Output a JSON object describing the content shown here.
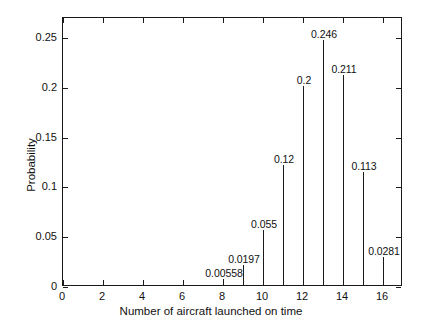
{
  "chart_data": {
    "type": "bar",
    "subtype": "stem",
    "title": "",
    "xlabel": "Number of aircraft launched on time",
    "ylabel": "Probability",
    "x": [
      8,
      9,
      10,
      11,
      12,
      13,
      14,
      15,
      16
    ],
    "values": [
      0.00558,
      0.0197,
      0.055,
      0.12,
      0.2,
      0.246,
      0.211,
      0.113,
      0.0281
    ],
    "point_labels": [
      "0.00558",
      "0.0197",
      "0.055",
      "0.12",
      "0.2",
      "0.246",
      "0.211",
      "0.113",
      "0.0281"
    ],
    "xlim": [
      0,
      17
    ],
    "ylim": [
      0,
      0.27
    ],
    "xticks": [
      0,
      2,
      4,
      6,
      8,
      10,
      12,
      14,
      16
    ],
    "xtick_labels": [
      "0",
      "2",
      "4",
      "6",
      "8",
      "10",
      "12",
      "14",
      "16"
    ],
    "yticks": [
      0,
      0.05,
      0.1,
      0.15,
      0.2,
      0.25
    ],
    "ytick_labels": [
      "0",
      "0.05",
      "0.1",
      "0.15",
      "0.2",
      "0.25"
    ],
    "grid": false,
    "legend": null,
    "axis_color": "#1a1a1a",
    "line_color": "#1a1a1a",
    "background": "#ffffff"
  }
}
